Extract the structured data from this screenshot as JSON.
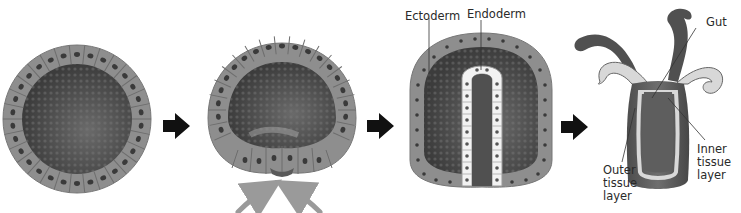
{
  "diagram": {
    "stages": [
      {
        "id": "blastula",
        "description": "hollow ball of cells"
      },
      {
        "id": "gastrulation-start",
        "description": "cells fold inward"
      },
      {
        "id": "gastrula",
        "description": "two-layered embryo"
      },
      {
        "id": "adult",
        "description": "adult form with tentacles"
      }
    ],
    "labels": {
      "ectoderm": "Ectoderm",
      "endoderm": "Endoderm",
      "gut": "Gut",
      "outer_tissue_layer": "Outer\ntissue\nlayer",
      "inner_tissue_layer": "Inner\ntissue\nlayer"
    },
    "arrows": {
      "count": 3,
      "color": "#111111"
    },
    "colors": {
      "cell_layer": "#8e8e8e",
      "cell_border": "#6d6d6d",
      "interior": "#4a4a4a",
      "endoderm_cells": "#f2f2f2",
      "invagination_arrows": "#9a9a9a",
      "adult_body": "#555555",
      "adult_inner_band": "#d8d8d8"
    }
  }
}
